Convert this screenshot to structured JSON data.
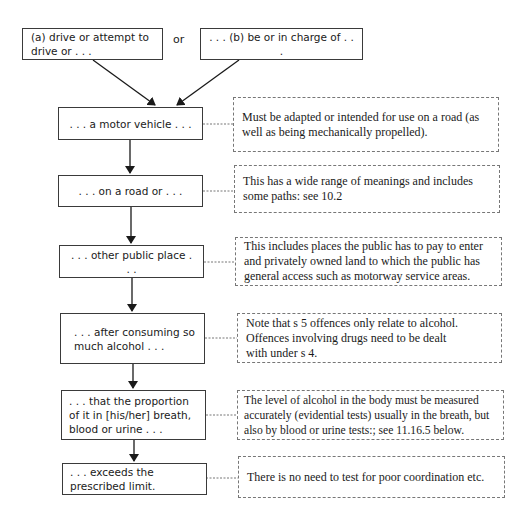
{
  "diagram": {
    "start_boxes": [
      {
        "label": "(a) drive or attempt to drive or . . ."
      },
      {
        "label": ". . . (b) be or in charge of . . ."
      }
    ],
    "connector_label": "or",
    "steps": [
      {
        "label": ". . . a motor vehicle . . .",
        "note": "Must be adapted or intended for use on a road (as well as being mechanically propelled)."
      },
      {
        "label": ". . . on a road or . . .",
        "note": "This has a wide range of meanings and includes some paths: see 10.2"
      },
      {
        "label": ". . . other public place . . .",
        "note": "This includes places the public has to pay to enter and privately owned land to which the public has general access such as motorway service areas."
      },
      {
        "label": ". . . after consuming so much alcohol . . .",
        "note": "Note that s 5 offences only relate to alcohol. Offences involving drugs need to be dealt with under s 4."
      },
      {
        "label": ". . . that the proportion of it in [his/her] breath, blood or urine . . .",
        "note": "The level of alcohol in the body must be measured accurately (evidential tests) usually in the breath, but also by blood or urine tests:; see 11.16.5 below."
      },
      {
        "label": ". . . exceeds the prescribed limit.",
        "note": "There is no need to test for poor coordination etc."
      }
    ],
    "colors": {
      "box_border": "#3a3a3a",
      "note_border": "#777777",
      "arrow": "#1a1a1a",
      "text": "#1a1a1a"
    }
  }
}
